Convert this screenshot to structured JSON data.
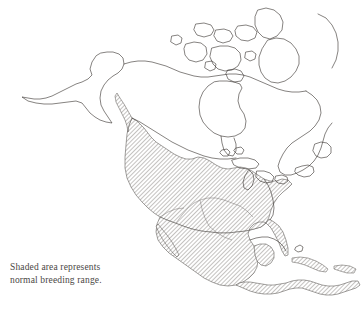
{
  "figure": {
    "kind": "range-map",
    "region": "North America",
    "title_visible": false
  },
  "caption": {
    "line1": "Shaded area represents",
    "line2": "normal breeding range."
  },
  "legend": {
    "shaded_meaning": "normal breeding range",
    "pattern": "diagonal-hatch"
  },
  "colors": {
    "background": "#ffffff",
    "coastline": "#3a3632",
    "hatch_line": "#8e8a86",
    "hatch_fill": "#ffffff",
    "caption_text": "#4a4744",
    "scan_edge": "#1a1a1a"
  },
  "map": {
    "shaded_areas": [
      "southern-british-columbia-coast",
      "western-united-states",
      "great-plains",
      "midwest",
      "southeastern-united-states",
      "florida",
      "mexico",
      "baja-california",
      "yucatan",
      "central-america",
      "cuba",
      "hispaniola"
    ],
    "unshaded_areas": [
      "alaska",
      "yukon",
      "northwest-territories",
      "canadian-arctic-archipelago",
      "hudson-bay-region",
      "northern-quebec",
      "labrador",
      "newfoundland",
      "greenland-margin",
      "appalachian-corridor",
      "great-lakes"
    ],
    "water_bodies": [
      "hudson-bay",
      "great-lakes",
      "gulf-of-mexico",
      "caribbean-sea"
    ]
  }
}
